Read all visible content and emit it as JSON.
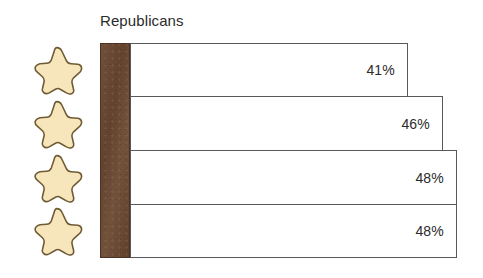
{
  "chart_data": {
    "type": "bar",
    "title": "Republicans",
    "orientation": "horizontal",
    "xlabel": "",
    "ylabel": "",
    "grid": false,
    "legend": "none",
    "xlim": [
      0,
      50
    ],
    "categories": [
      "star-cream",
      "star-peach",
      "star-mauve",
      "star-purple"
    ],
    "values": [
      41,
      46,
      48,
      48
    ],
    "value_labels": [
      "41%",
      "46%",
      "48%",
      "48%"
    ],
    "tick_labels": [],
    "annotations": []
  },
  "chart": {
    "title": "Republicans",
    "axis_band_color": "#6b4b36",
    "bar_border_color": "#595959",
    "bar_fill_color": "#ffffff",
    "text_color": "#2b2b2b",
    "rows": [
      {
        "icon": "star-icon",
        "icon_fill": "#f7e6bc",
        "icon_stroke": "#6f5b33",
        "value_label": "41%",
        "value": 41,
        "bar_width_px": 278
      },
      {
        "icon": "star-icon",
        "icon_fill": "#f9cdb5",
        "icon_stroke": "#8a6350",
        "value_label": "46%",
        "value": 46,
        "bar_width_px": 313
      },
      {
        "icon": "star-icon",
        "icon_fill": "#d8b6c4",
        "icon_stroke": "#7d5a63",
        "value_label": "48%",
        "value": 48,
        "bar_width_px": 327
      },
      {
        "icon": "star-icon",
        "icon_fill": "#9b76b8",
        "icon_stroke": "#5d4273",
        "value_label": "48%",
        "value": 48,
        "bar_width_px": 327
      }
    ]
  }
}
